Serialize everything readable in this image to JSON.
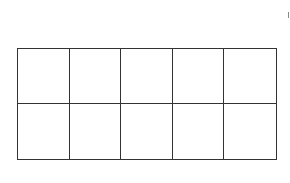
{
  "diagram": {
    "type": "ten-frame",
    "rows": 2,
    "columns": 5,
    "cells": [
      {
        "row": 1,
        "col": 1,
        "filled": false
      },
      {
        "row": 1,
        "col": 2,
        "filled": false
      },
      {
        "row": 1,
        "col": 3,
        "filled": false
      },
      {
        "row": 1,
        "col": 4,
        "filled": false
      },
      {
        "row": 1,
        "col": 5,
        "filled": false
      },
      {
        "row": 2,
        "col": 1,
        "filled": false
      },
      {
        "row": 2,
        "col": 2,
        "filled": false
      },
      {
        "row": 2,
        "col": 3,
        "filled": false
      },
      {
        "row": 2,
        "col": 4,
        "filled": false
      },
      {
        "row": 2,
        "col": 5,
        "filled": false
      }
    ],
    "line_color": "#333333",
    "background": "#ffffff"
  }
}
